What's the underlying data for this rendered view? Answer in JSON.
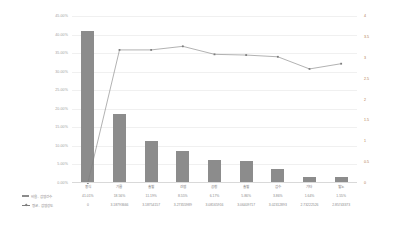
{
  "chart_data": {
    "type": "bar",
    "title": "",
    "subtitle": "",
    "xlabel": "",
    "ylabel": "",
    "grid": true,
    "legend_position": "bottom-left",
    "categories": [
      "중식",
      "기름",
      "출혈",
      "간염",
      "공청",
      "출혈",
      "감수",
      "기타",
      "혈노"
    ],
    "axes": {
      "left": {
        "label": "",
        "ticks": [
          "0.00%",
          "5.00%",
          "10.00%",
          "15.00%",
          "20.00%",
          "25.00%",
          "30.00%",
          "35.00%",
          "40.00%",
          "45.00%"
        ],
        "values": [
          0,
          5,
          10,
          15,
          20,
          25,
          30,
          35,
          40,
          45
        ],
        "min": 0,
        "max": 45,
        "color": "#9e9e9e"
      },
      "right": {
        "label": "",
        "ticks": [
          "0",
          "0.5",
          "1",
          "1.5",
          "2",
          "2.5",
          "3",
          "3.5",
          "4"
        ],
        "values": [
          0,
          0.5,
          1,
          1.5,
          2,
          2.5,
          3,
          3.5,
          4
        ],
        "min": 0,
        "max": 4,
        "color": "#b07a4a"
      }
    },
    "series": [
      {
        "name": "비율 - 감염건수",
        "type": "bar",
        "axis": "left",
        "color": "#8c8c8c",
        "values": [
          41.01,
          18.56,
          11.19,
          8.55,
          6.17,
          5.86,
          3.86,
          1.64,
          1.55
        ],
        "labels": [
          "41.01%",
          "18.56%",
          "11.19%",
          "8.55%",
          "6.17%",
          "5.86%",
          "3.86%",
          "1.64%",
          "1.55%"
        ]
      },
      {
        "name": "평균 - 감염강도",
        "type": "line",
        "axis": "right",
        "color": "#7d7d7d",
        "marker": "square",
        "values": [
          0,
          3.1879,
          3.1875,
          3.2735,
          3.0816,
          3.0645,
          3.0231,
          2.7322,
          2.8574
        ],
        "labels": [
          "0",
          "3.18793666",
          "3.18754157",
          "3.27355989",
          "3.08165916",
          "3.06409717",
          "3.02312893",
          "2.73222526",
          "2.85743373"
        ]
      }
    ]
  }
}
